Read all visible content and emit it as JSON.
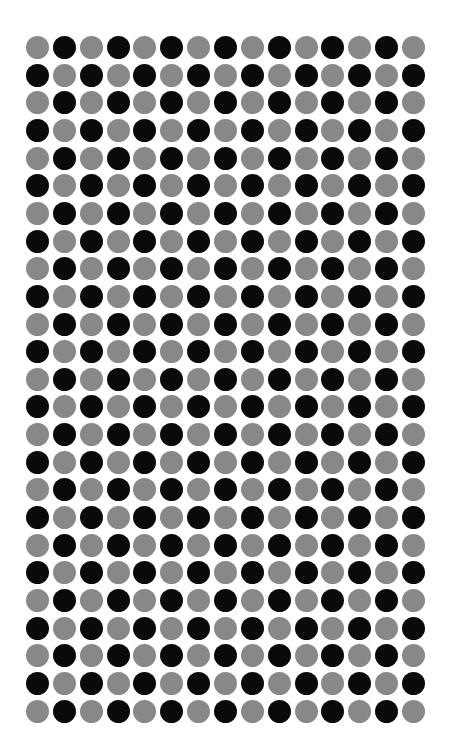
{
  "pattern": {
    "type": "checkerboard-dot-grid",
    "rows": 25,
    "cols": 15,
    "first_center_x": 37.5,
    "first_center_y": 47.5,
    "spacing_x": 26.86,
    "spacing_y": 27.65,
    "dot_diameter": 23,
    "odd_row_first_color": "gray",
    "even_row_first_color": "black"
  },
  "colors": {
    "background": "#ffffff",
    "gray": "#888888",
    "black": "#0a0a0a"
  }
}
